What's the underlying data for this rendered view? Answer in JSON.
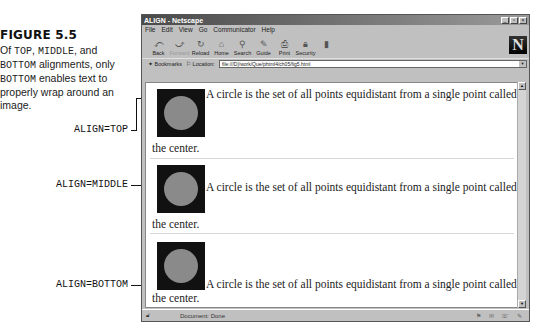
{
  "caption": {
    "figure_label": "FIGURE 5.5",
    "description_parts": [
      {
        "text": "Of ",
        "mono": false
      },
      {
        "text": "TOP",
        "mono": true
      },
      {
        "text": ", ",
        "mono": false
      },
      {
        "text": "MIDDLE",
        "mono": true
      },
      {
        "text": ", and ",
        "mono": false
      },
      {
        "text": "BOTTOM",
        "mono": true
      },
      {
        "text": " alignments, only ",
        "mono": false
      },
      {
        "text": "BOTTOM",
        "mono": true
      },
      {
        "text": " enables text to properly wrap around an image.",
        "mono": false
      }
    ]
  },
  "callouts": [
    {
      "label": "ALIGN=TOP"
    },
    {
      "label": "ALIGN=MIDDLE"
    },
    {
      "label": "ALIGN=BOTTOM"
    }
  ],
  "browser": {
    "title": "ALIGN - Netscape",
    "window_buttons": [
      "_",
      "▫",
      "×"
    ],
    "menu": [
      "File",
      "Edit",
      "View",
      "Go",
      "Communicator",
      "Help"
    ],
    "toolbar": [
      {
        "label": "Back",
        "icon": "⤺",
        "enabled": true
      },
      {
        "label": "Forward",
        "icon": "⤻",
        "enabled": false
      },
      {
        "label": "Reload",
        "icon": "↻",
        "enabled": true
      },
      {
        "label": "Home",
        "icon": "⌂",
        "enabled": true
      },
      {
        "label": "Search",
        "icon": "⚲",
        "enabled": true
      },
      {
        "label": "Guide",
        "icon": "✎",
        "enabled": true
      },
      {
        "label": "Print",
        "icon": "⎙",
        "enabled": true
      },
      {
        "label": "Security",
        "icon": "🔒︎",
        "enabled": true
      },
      {
        "label": "Stop",
        "icon": "▮",
        "enabled": false
      }
    ],
    "logo": "N",
    "bookmarks_label": "Bookmarks",
    "location_label": "Location:",
    "location_url": "file:///D|/work/Que/phtml4/ch05/fig5.html",
    "status_text": "Document: Done"
  },
  "content": {
    "paragraph_main": "A circle is the set of all points equidistant from a single point called",
    "paragraph_tail": "the center."
  }
}
